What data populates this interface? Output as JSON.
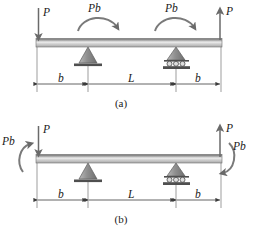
{
  "figure": {
    "type": "free-body-diagram",
    "background_color": "#ffffff",
    "ink_color": "#3a3a3a",
    "beam_fill_dark": "#6e6e6e",
    "beam_fill_light": "#e8e8e8",
    "support_fill": "#9a9a9a",
    "panels": [
      {
        "id": "a",
        "caption": "(a)",
        "left_force": {
          "label": "P",
          "direction": "down"
        },
        "right_force": {
          "label": "P",
          "direction": "up"
        },
        "moments": [
          {
            "label": "Pb",
            "sense": "clockwise",
            "position": "left-span"
          },
          {
            "label": "Pb",
            "sense": "clockwise",
            "position": "right-span"
          }
        ],
        "supports": [
          {
            "kind": "pin",
            "position": "left"
          },
          {
            "kind": "roller",
            "position": "right",
            "roller_count": 3
          }
        ],
        "dimensions": [
          {
            "label": "b",
            "segment": "left-overhang"
          },
          {
            "label": "L",
            "segment": "span"
          },
          {
            "label": "b",
            "segment": "right-overhang"
          }
        ]
      },
      {
        "id": "b",
        "caption": "(b)",
        "left_force": {
          "label": "P",
          "direction": "down"
        },
        "right_force": {
          "label": "P",
          "direction": "up"
        },
        "moments": [
          {
            "label": "Pb",
            "sense": "counterclockwise",
            "position": "left-end"
          },
          {
            "label": "Pb",
            "sense": "clockwise",
            "position": "right-end"
          }
        ],
        "supports": [
          {
            "kind": "pin",
            "position": "left"
          },
          {
            "kind": "roller",
            "position": "right",
            "roller_count": 3
          }
        ],
        "dimensions": [
          {
            "label": "b",
            "segment": "left-overhang"
          },
          {
            "label": "L",
            "segment": "span"
          },
          {
            "label": "b",
            "segment": "right-overhang"
          }
        ]
      }
    ]
  }
}
